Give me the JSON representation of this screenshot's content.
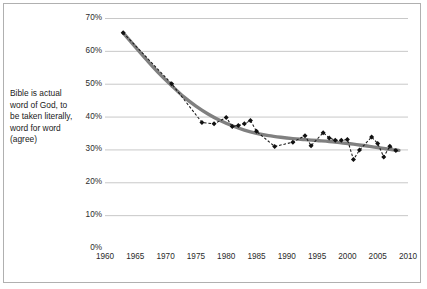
{
  "figure": {
    "clipped_title": "(Gallup)",
    "series_label": "Bible is actual word of God, to be taken literally, word for word (agree)",
    "frame_color": "#b0b0b0",
    "background_color": "#ffffff"
  },
  "chart_data": {
    "type": "line",
    "title": "",
    "subtitle": "",
    "xlabel": "",
    "ylabel": "",
    "xlim": [
      1960,
      2010
    ],
    "ylim": [
      0,
      70
    ],
    "xticks": [
      1960,
      1965,
      1970,
      1975,
      1980,
      1985,
      1990,
      1995,
      2000,
      2005,
      2010
    ],
    "xtick_labels": [
      "1960",
      "1965",
      "1970",
      "1975",
      "1980",
      "1985",
      "1990",
      "1995",
      "2000",
      "2005",
      "2010"
    ],
    "yticks": [
      0,
      10,
      20,
      30,
      40,
      50,
      60,
      70
    ],
    "ytick_labels": [
      "0%",
      "10%",
      "20%",
      "30%",
      "40%",
      "50%",
      "60%",
      "70%"
    ],
    "grid": "horizontal",
    "legend": "none",
    "colors": {
      "data_line": "#1a1a1a",
      "marker": "#111111",
      "trendline": "#808080",
      "gridline": "#c8c8c8"
    },
    "series": [
      {
        "name": "Bible is actual word of God, to be taken literally, word for word (agree)",
        "style": "dashed-with-diamond-markers",
        "x": [
          1963,
          1971,
          1976,
          1978,
          1980,
          1981,
          1982,
          1983,
          1984,
          1985,
          1988,
          1991,
          1993,
          1994,
          1996,
          1997,
          1998,
          1999,
          2000,
          2001,
          2002,
          2004,
          2005,
          2006,
          2007,
          2008
        ],
        "values": [
          65.5,
          50.0,
          38.2,
          37.8,
          39.7,
          37.0,
          37.3,
          37.8,
          38.8,
          35.5,
          30.9,
          32.2,
          34.2,
          31.1,
          35.1,
          33.5,
          32.8,
          32.8,
          33.0,
          26.9,
          29.8,
          33.8,
          31.8,
          27.7,
          31.0,
          29.7
        ]
      },
      {
        "name": "Trend line",
        "style": "thick-smooth-gray-curve",
        "x": [
          1963,
          1965,
          1967,
          1969,
          1971,
          1973,
          1975,
          1977,
          1979,
          1981,
          1983,
          1985,
          1987,
          1989,
          1991,
          1993,
          1995,
          1997,
          1999,
          2001,
          2003,
          2005,
          2007,
          2008.5
        ],
        "values": [
          65.5,
          61.2,
          57.0,
          53.0,
          49.4,
          46.0,
          43.2,
          40.8,
          38.8,
          37.2,
          35.9,
          34.9,
          34.2,
          33.7,
          33.3,
          33.0,
          32.7,
          32.4,
          32.0,
          31.6,
          31.1,
          30.6,
          30.0,
          29.7
        ]
      }
    ]
  }
}
